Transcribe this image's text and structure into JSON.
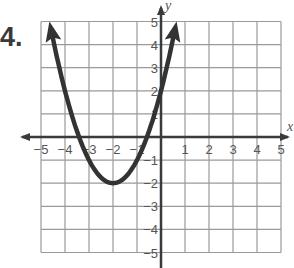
{
  "problem": {
    "number": "4."
  },
  "chart_data": {
    "type": "line",
    "title": "",
    "xlabel": "x",
    "ylabel": "y",
    "xlim": [
      -5,
      5
    ],
    "ylim": [
      -5,
      5
    ],
    "grid": true,
    "x_ticks": [
      "-5",
      "-4",
      "-3",
      "-2",
      "-1",
      "1",
      "2",
      "3",
      "4",
      "5"
    ],
    "y_ticks": [
      "5",
      "4",
      "3",
      "2",
      "1",
      "-1",
      "-2",
      "-3",
      "-4",
      "-5"
    ],
    "series": [
      {
        "name": "parabola",
        "equation": "y = (x + 2)^2 - 2",
        "vertex": [
          -2,
          -2
        ],
        "y_intercept": 2,
        "x_intercepts": [
          -3.41,
          -0.59
        ],
        "arrow_ends": [
          [
            -4.65,
            5
          ],
          [
            0.65,
            5
          ]
        ],
        "x": [
          -4.65,
          -4,
          -3.5,
          -3,
          -2.5,
          -2,
          -1.5,
          -1,
          -0.5,
          0,
          0.65
        ],
        "y": [
          5,
          2,
          0.25,
          -1,
          -1.75,
          -2,
          -1.75,
          -1,
          0.25,
          2,
          5
        ]
      }
    ],
    "colors": {
      "curve": "#333333",
      "grid": "#9a9a9a",
      "axis": "#3a3a3a"
    }
  }
}
